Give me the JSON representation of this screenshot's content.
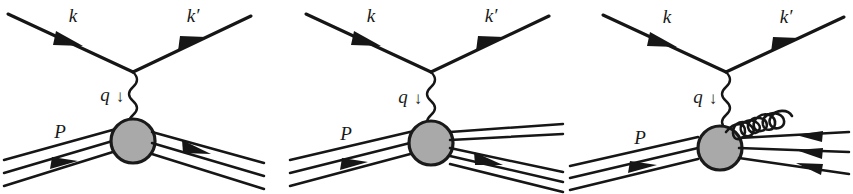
{
  "figure": {
    "name": "deep-inelastic-scattering-feynman-diagrams",
    "background_color": "#ffffff",
    "line_color": "#161616",
    "blob_fill_color": "#a9a9a9",
    "blob_stroke_color": "#1a1a1a",
    "panel_count": 3
  },
  "labels": {
    "incoming_lepton": "k",
    "outgoing_lepton": "k′",
    "exchanged_boson": "q",
    "boson_direction_arrow": "↓",
    "proton": "P"
  },
  "panels": [
    {
      "id": "panel-0",
      "name": "elastic-scattering-diagram",
      "index": 1,
      "labels": {
        "incoming_lepton": "k",
        "outgoing_lepton": "k′",
        "exchanged_boson": "q",
        "boson_direction_arrow": "↓",
        "proton": "P"
      },
      "elements": {
        "incoming_lepton_line": "k",
        "outgoing_lepton_line": "k′",
        "photon_propagator": "q",
        "hadron_blob": "blob",
        "incoming_parton_lines": 3,
        "outgoing_parton_lines": 3,
        "gluon_lines": 0
      }
    },
    {
      "id": "panel-1",
      "name": "inelastic-scattering-diagram",
      "index": 2,
      "labels": {
        "incoming_lepton": "k",
        "outgoing_lepton": "k′",
        "exchanged_boson": "q",
        "boson_direction_arrow": "↓",
        "proton": "P"
      },
      "elements": {
        "incoming_lepton_line": "k",
        "outgoing_lepton_line": "k′",
        "photon_propagator": "q",
        "hadron_blob": "blob",
        "incoming_parton_lines": 3,
        "outgoing_parton_lines": 5,
        "gluon_lines": 0
      }
    },
    {
      "id": "panel-2",
      "name": "gluon-radiation-diagram",
      "index": 3,
      "labels": {
        "incoming_lepton": "k",
        "outgoing_lepton": "k′",
        "exchanged_boson": "q",
        "boson_direction_arrow": "↓",
        "proton": "P"
      },
      "elements": {
        "incoming_lepton_line": "k",
        "outgoing_lepton_line": "k′",
        "photon_propagator": "q",
        "hadron_blob": "blob",
        "incoming_parton_lines": 3,
        "outgoing_parton_lines": 3,
        "gluon_lines": 1,
        "gluon_loop_count": 7
      }
    }
  ]
}
